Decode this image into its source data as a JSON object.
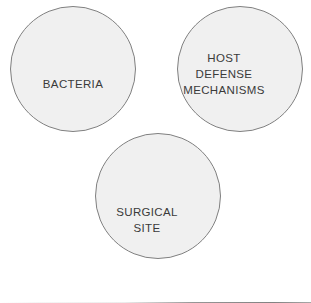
{
  "diagram": {
    "type": "venn",
    "title": "",
    "background_color": "#ffffff",
    "circle_fill": "#f0f0f0",
    "overlap_fill": "#b8b8b8",
    "stroke_color": "#808080",
    "label_color": "#3a3a3a",
    "sets": [
      {
        "id": "bacteria",
        "label": "BACTERIA",
        "lines": [
          "BACTERIA"
        ],
        "cx": 73,
        "cy": 69,
        "r": 62.5,
        "label_x": 73,
        "label_y": 88
      },
      {
        "id": "host-defense-mechanisms",
        "label": "HOST DEFENSE MECHANISMS",
        "lines": [
          "HOST",
          "DEFENSE",
          "MECHANISMS"
        ],
        "cx": 240,
        "cy": 69,
        "r": 62.5,
        "label_x": 224,
        "label_y": 62
      },
      {
        "id": "surgical-site",
        "label": "SURGICAL SITE",
        "lines": [
          "SURGICAL",
          "SITE"
        ],
        "cx": 158,
        "cy": 196,
        "r": 62.5,
        "label_x": 147,
        "label_y": 216
      }
    ],
    "intersections": [
      {
        "id": "bacteria-host-defense",
        "sets": [
          "bacteria",
          "host-defense-mechanisms"
        ],
        "label": ""
      },
      {
        "id": "bacteria-surgical-site",
        "sets": [
          "bacteria",
          "surgical-site"
        ],
        "label": ""
      },
      {
        "id": "host-defense-surgical-site",
        "sets": [
          "host-defense-mechanisms",
          "surgical-site"
        ],
        "label": ""
      }
    ],
    "convergence_point": {
      "x": 158,
      "y": 131
    },
    "labels": {
      "bacteria": "BACTERIA",
      "host_line1": "HOST",
      "host_line2": "DEFENSE",
      "host_line3": "MECHANISMS",
      "site_line1": "SURGICAL",
      "site_line2": "SITE"
    }
  }
}
